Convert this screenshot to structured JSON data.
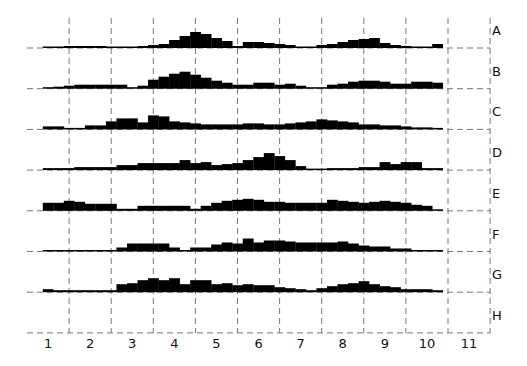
{
  "chart_data": {
    "type": "bar",
    "title": "",
    "xlabel": "",
    "ylabel": "",
    "x_ticks": [
      "1",
      "2",
      "3",
      "4",
      "5",
      "6",
      "7",
      "8",
      "9",
      "10",
      "11"
    ],
    "xlim": [
      0.5,
      11.5
    ],
    "bin_start": 0.875,
    "bin_width": 0.25,
    "grid": true,
    "row_label_placement": "right",
    "series": [
      {
        "name": "A",
        "values": [
          1,
          1,
          2,
          2,
          2,
          2,
          1,
          1,
          1,
          2,
          3,
          4,
          8,
          12,
          16,
          14,
          10,
          7,
          2,
          6,
          6,
          5,
          4,
          3,
          1,
          1,
          3,
          4,
          6,
          8,
          9,
          10,
          5,
          3,
          2,
          1,
          1,
          4,
          4,
          6,
          6,
          4
        ]
      },
      {
        "name": "B",
        "values": [
          1,
          2,
          3,
          4,
          4,
          4,
          4,
          4,
          1,
          3,
          9,
          12,
          15,
          17,
          14,
          11,
          8,
          6,
          4,
          4,
          6,
          6,
          4,
          5,
          3,
          1,
          1,
          4,
          5,
          7,
          8,
          8,
          7,
          5,
          5,
          7,
          7,
          6,
          6,
          5
        ]
      },
      {
        "name": "C",
        "values": [
          3,
          3,
          1,
          1,
          4,
          4,
          8,
          11,
          11,
          7,
          14,
          13,
          8,
          7,
          6,
          5,
          5,
          5,
          5,
          6,
          6,
          5,
          5,
          6,
          7,
          8,
          10,
          9,
          8,
          7,
          5,
          5,
          4,
          4,
          3,
          2,
          2,
          1,
          1,
          1
        ]
      },
      {
        "name": "D",
        "values": [
          2,
          2,
          2,
          3,
          3,
          3,
          3,
          5,
          5,
          7,
          7,
          7,
          7,
          10,
          7,
          8,
          5,
          6,
          7,
          10,
          13,
          17,
          14,
          10,
          4,
          1,
          1,
          2,
          2,
          2,
          3,
          3,
          8,
          6,
          8,
          8,
          2,
          2,
          2,
          3,
          3,
          3,
          2,
          2,
          2
        ]
      },
      {
        "name": "E",
        "values": [
          8,
          8,
          10,
          9,
          7,
          7,
          7,
          2,
          2,
          5,
          5,
          5,
          5,
          5,
          2,
          5,
          8,
          10,
          11,
          12,
          11,
          9,
          9,
          8,
          8,
          8,
          8,
          11,
          10,
          9,
          8,
          9,
          10,
          9,
          8,
          6,
          5,
          1,
          1,
          1
        ]
      },
      {
        "name": "F",
        "values": [
          1,
          1,
          1,
          1,
          1,
          1,
          1,
          4,
          8,
          8,
          8,
          8,
          4,
          1,
          4,
          4,
          7,
          9,
          8,
          13,
          9,
          11,
          11,
          10,
          9,
          9,
          9,
          9,
          10,
          8,
          6,
          5,
          5,
          3,
          3,
          1,
          1,
          1,
          1,
          2
        ]
      },
      {
        "name": "G",
        "values": [
          3,
          2,
          2,
          2,
          2,
          2,
          2,
          8,
          9,
          12,
          14,
          12,
          14,
          8,
          12,
          12,
          8,
          9,
          7,
          8,
          7,
          7,
          5,
          4,
          3,
          2,
          4,
          6,
          8,
          9,
          11,
          8,
          6,
          5,
          3,
          3,
          3,
          2,
          2,
          1,
          1
        ]
      },
      {
        "name": "H",
        "values": []
      }
    ]
  }
}
